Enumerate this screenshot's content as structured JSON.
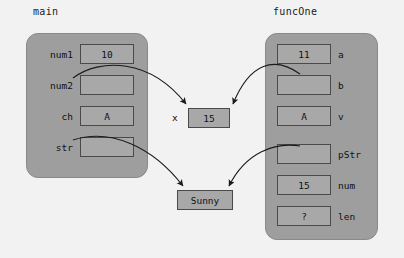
{
  "canvas": {
    "width": 404,
    "height": 258,
    "background": "#f2f2f2"
  },
  "colors": {
    "frame_fill": "#9e9e9e",
    "cell_fill": "#a8a8a8",
    "cell_border": "#4a4a4a",
    "text": "#111111",
    "arrow": "#1a1a1a"
  },
  "frames": [
    {
      "id": "main",
      "title": "main",
      "label_side": "left",
      "rows": [
        {
          "label": "num1",
          "value": "10"
        },
        {
          "label": "num2",
          "value": ""
        },
        {
          "label": "ch",
          "value": "A"
        },
        {
          "label": "str",
          "value": ""
        }
      ]
    },
    {
      "id": "funcOne",
      "title": "funcOne",
      "label_side": "right",
      "rows": [
        {
          "label": "a",
          "value": "11"
        },
        {
          "label": "b",
          "value": ""
        },
        {
          "label": "v",
          "value": "A"
        },
        {
          "label": "pStr",
          "value": ""
        },
        {
          "label": "num",
          "value": "15"
        },
        {
          "label": "len",
          "value": "?"
        }
      ]
    }
  ],
  "heap_boxes": [
    {
      "id": "x-box",
      "label": "x",
      "value": "15"
    },
    {
      "id": "sunny-box",
      "label": "",
      "value": "Sunny"
    }
  ],
  "arrows": [
    {
      "id": "num2-to-x",
      "from": "main.num2",
      "to": "x-box"
    },
    {
      "id": "b-to-x",
      "from": "funcOne.b",
      "to": "x-box"
    },
    {
      "id": "str-to-sunny",
      "from": "main.str",
      "to": "sunny-box"
    },
    {
      "id": "pstr-to-sunny",
      "from": "funcOne.pStr",
      "to": "sunny-box"
    }
  ]
}
